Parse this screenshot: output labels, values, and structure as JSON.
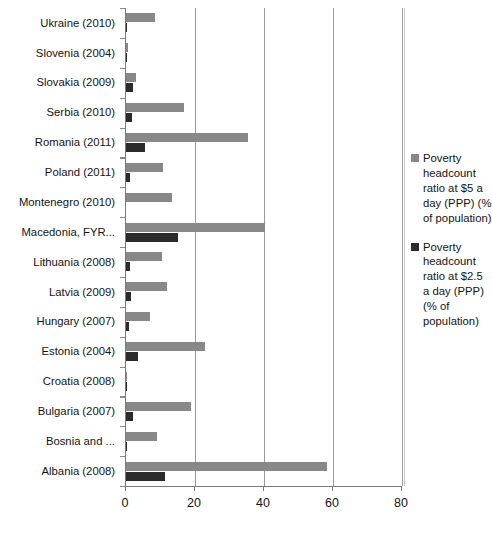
{
  "chart_data": {
    "type": "bar",
    "orientation": "horizontal",
    "title": "",
    "xlabel": "",
    "ylabel": "",
    "xlim": [
      0,
      80
    ],
    "xticks": [
      0,
      20,
      40,
      60,
      80
    ],
    "grid": true,
    "legend_position": "right",
    "categories": [
      "Ukraine (2010)",
      "Slovenia (2004)",
      "Slovakia (2009)",
      "Serbia (2010)",
      "Romania (2011)",
      "Poland (2011)",
      "Montenegro (2010)",
      "Macedonia, FYR...",
      "Lithuania (2008)",
      "Latvia (2009)",
      "Hungary (2007)",
      "Estonia (2004)",
      "Croatia (2008)",
      "Bulgaria (2007)",
      "Bosnia and ...",
      "Albania (2008)"
    ],
    "series": [
      {
        "name": "Poverty headcount ratio at $5 a day (PPP) (% of population)",
        "color": "#888888",
        "values": [
          8.5,
          0.6,
          3.0,
          16.7,
          35.4,
          10.8,
          13.2,
          40.3,
          10.5,
          12.0,
          7.0,
          22.8,
          0.4,
          18.7,
          9.0,
          58.2
        ]
      },
      {
        "name": "Poverty headcount ratio at $2.5 a day (PPP) (% of population)",
        "color": "#2b2b2b",
        "values": [
          0.2,
          0.4,
          2.0,
          1.8,
          5.6,
          1.2,
          0.0,
          15.2,
          1.2,
          1.4,
          1.0,
          3.4,
          0.3,
          2.1,
          0.3,
          11.4
        ]
      }
    ]
  },
  "legend": {
    "entries": [
      {
        "label": "Poverty headcount ratio at $5 a day (PPP) (% of population)",
        "color": "#888888"
      },
      {
        "label": "Poverty headcount ratio at $2.5 a day (PPP) (% of population)",
        "color": "#2b2b2b"
      }
    ]
  }
}
